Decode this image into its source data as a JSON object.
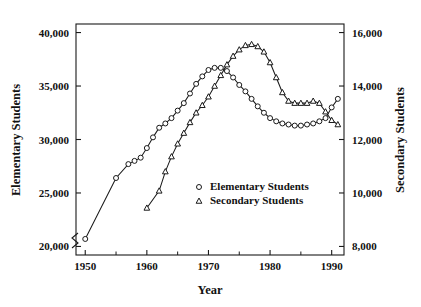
{
  "chart_data": {
    "type": "line",
    "title": "",
    "xlabel": "Year",
    "ylabel": "Elementary Students",
    "y2label": "Secondary Students",
    "xlim": [
      1948.5,
      1992.0
    ],
    "ylim": [
      19200,
      40800
    ],
    "y2lim": [
      7680,
      16320
    ],
    "grid": false,
    "legend_position": "center",
    "axis_break_note": "broken axis marks on left y-axis and x-axis origin corner",
    "xticks": [
      1950,
      1960,
      1970,
      1980,
      1990
    ],
    "xtick_labels": [
      "1950",
      "1960",
      "1970",
      "1980",
      "1990"
    ],
    "xminor_ticks": [
      1955,
      1965,
      1975,
      1985
    ],
    "yticks": [
      20000,
      25000,
      30000,
      35000,
      40000
    ],
    "ytick_labels": [
      "20,000",
      "25,000",
      "30,000",
      "35,000",
      "40,000"
    ],
    "y2ticks": [
      8000,
      10000,
      12000,
      14000,
      16000
    ],
    "y2tick_labels": [
      "8,000",
      "10,000",
      "12,000",
      "14,000",
      "16,000"
    ],
    "series": [
      {
        "name": "Elementary Students",
        "marker": "circle",
        "axis": "left",
        "x": [
          1950,
          1955,
          1957,
          1958,
          1959,
          1960,
          1961,
          1962,
          1963,
          1964,
          1965,
          1966,
          1967,
          1968,
          1969,
          1970,
          1971,
          1972,
          1973,
          1974,
          1975,
          1976,
          1977,
          1978,
          1979,
          1980,
          1981,
          1982,
          1983,
          1984,
          1985,
          1986,
          1987,
          1988,
          1989,
          1990,
          1991
        ],
        "values": [
          20700,
          26400,
          27700,
          28000,
          28300,
          29200,
          30200,
          31100,
          31500,
          32000,
          32700,
          33400,
          34300,
          35200,
          35900,
          36500,
          36700,
          36700,
          36400,
          35800,
          35100,
          34500,
          33800,
          33100,
          32500,
          32000,
          31700,
          31500,
          31400,
          31300,
          31300,
          31400,
          31500,
          31700,
          32000,
          33000,
          33800
        ]
      },
      {
        "name": "Secondary Students",
        "marker": "triangle",
        "axis": "right",
        "x": [
          1960,
          1962,
          1963,
          1964,
          1965,
          1966,
          1967,
          1968,
          1969,
          1970,
          1971,
          1972,
          1973,
          1974,
          1975,
          1976,
          1977,
          1978,
          1979,
          1980,
          1981,
          1982,
          1983,
          1984,
          1985,
          1986,
          1987,
          1988,
          1989,
          1990,
          1991
        ],
        "values": [
          9440,
          10080,
          10800,
          11360,
          11840,
          12240,
          12640,
          13000,
          13280,
          13600,
          14000,
          14400,
          14800,
          15120,
          15360,
          15520,
          15560,
          15480,
          15280,
          14880,
          14320,
          13760,
          13440,
          13360,
          13360,
          13360,
          13440,
          13360,
          13040,
          12720,
          12560
        ]
      }
    ],
    "legend": [
      {
        "marker": "circle",
        "label": "Elementary Students"
      },
      {
        "marker": "triangle",
        "label": "Secondary Students"
      }
    ]
  },
  "colors": {
    "ink": "#1a1a1a",
    "background": "#ffffff",
    "marker_fill": "#ffffff"
  }
}
